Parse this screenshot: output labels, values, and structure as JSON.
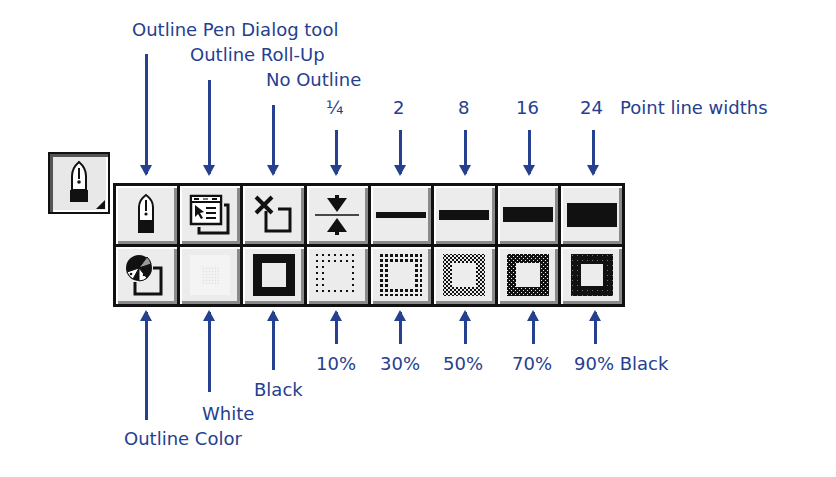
{
  "colors": {
    "annotation": "#25408f",
    "button_face": "#ececec",
    "border": "#111111"
  },
  "flyout_button": {
    "icon": "pen-nib-icon"
  },
  "top_labels": {
    "outline_pen_dialog": "Outline Pen Dialog tool",
    "outline_roll_up": "Outline Roll-Up",
    "no_outline": "No Outline",
    "w_quarter": "¼",
    "w_2": "2",
    "w_8": "8",
    "w_16": "16",
    "w_24": "24",
    "point_line_widths": "Point line widths"
  },
  "bottom_labels": {
    "outline_color": "Outline Color",
    "white": "White",
    "black": "Black",
    "p10": "10%",
    "p30": "30%",
    "p50": "50%",
    "p70": "70%",
    "p90": "90% Black"
  },
  "toolbar": {
    "row1": [
      {
        "name": "Outline Pen Dialog",
        "icon": "pen-nib-icon"
      },
      {
        "name": "Outline Roll-Up",
        "icon": "roll-up-window-icon"
      },
      {
        "name": "No Outline",
        "icon": "no-outline-x-icon"
      },
      {
        "name": "1/4 point",
        "icon": "hairline-width-icon"
      },
      {
        "name": "2 point",
        "icon": "line-2pt-icon"
      },
      {
        "name": "8 point",
        "icon": "line-8pt-icon"
      },
      {
        "name": "16 point",
        "icon": "line-16pt-icon"
      },
      {
        "name": "24 point",
        "icon": "line-24pt-icon"
      }
    ],
    "row2": [
      {
        "name": "Outline Color",
        "icon": "color-wheel-icon"
      },
      {
        "name": "White",
        "icon": "white-swatch-icon"
      },
      {
        "name": "Black",
        "icon": "black-swatch-icon"
      },
      {
        "name": "10% Black",
        "icon": "gray-10-swatch-icon"
      },
      {
        "name": "30% Black",
        "icon": "gray-30-swatch-icon"
      },
      {
        "name": "50% Black",
        "icon": "gray-50-swatch-icon"
      },
      {
        "name": "70% Black",
        "icon": "gray-70-swatch-icon"
      },
      {
        "name": "90% Black",
        "icon": "gray-90-swatch-icon"
      }
    ]
  }
}
